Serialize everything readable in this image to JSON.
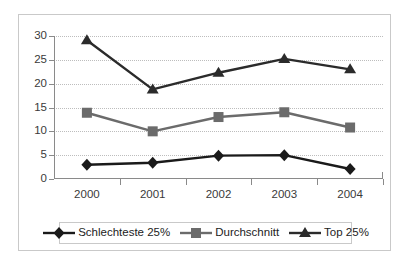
{
  "chart_data": {
    "type": "line",
    "title": "",
    "xlabel": "",
    "ylabel": "",
    "categories": [
      "2000",
      "2001",
      "2002",
      "2003",
      "2004"
    ],
    "ylim": [
      0,
      30
    ],
    "yticks": [
      0,
      5,
      10,
      15,
      20,
      25,
      30
    ],
    "grid": true,
    "legend_position": "bottom",
    "series": [
      {
        "name": "Schlechteste 25%",
        "marker": "diamond",
        "color": "#1a1a1a",
        "values": [
          3,
          3.4,
          4.9,
          5,
          2.1
        ]
      },
      {
        "name": "Durchschnitt",
        "marker": "square",
        "color": "#6b6b6b",
        "values": [
          13.9,
          10,
          13,
          14,
          10.8
        ]
      },
      {
        "name": "Top 25%",
        "marker": "triangle",
        "color": "#2b2b2b",
        "values": [
          29.1,
          18.8,
          22.3,
          25.2,
          23
        ]
      }
    ]
  },
  "axis": {
    "y_tick_labels": [
      "30",
      "25",
      "20",
      "15",
      "10",
      "5",
      "0"
    ],
    "x_tick_labels": [
      "2000",
      "2001",
      "2002",
      "2003",
      "2004"
    ]
  },
  "legend": {
    "entries": [
      {
        "label": "Schlechteste 25%",
        "marker": "diamond-marker-icon",
        "color": "#1a1a1a"
      },
      {
        "label": "Durchschnitt",
        "marker": "square-marker-icon",
        "color": "#6b6b6b"
      },
      {
        "label": "Top 25%",
        "marker": "triangle-marker-icon",
        "color": "#2b2b2b"
      }
    ]
  },
  "colors": {
    "frame_border": "#c9c9c9",
    "axis_line": "#8a8a8a",
    "gridline": "#bdbdbd",
    "background": "#ffffff",
    "tick_text": "#3a3a3a"
  }
}
